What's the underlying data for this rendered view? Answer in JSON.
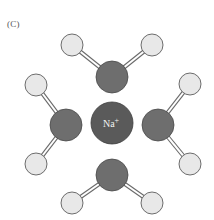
{
  "figure": {
    "panel_label": "(C)",
    "central_ion": {
      "label": "Na",
      "charge": "+",
      "cx": 112,
      "cy": 123,
      "r": 21,
      "color": "#5a5a5a"
    },
    "colors": {
      "oxygen": "#6e6e6e",
      "hydrogen": "#e8e8e8",
      "stroke": "#4a4a4a",
      "bond_outline": "#6a6a6a",
      "bond_fill": "#ffffff"
    },
    "water_molecules": [
      {
        "name": "top",
        "oxygen": {
          "cx": 112,
          "cy": 77,
          "r": 16
        },
        "hydrogens": [
          {
            "cx": 72,
            "cy": 45,
            "r": 11
          },
          {
            "cx": 152,
            "cy": 45,
            "r": 11
          }
        ]
      },
      {
        "name": "left",
        "oxygen": {
          "cx": 66,
          "cy": 125,
          "r": 16
        },
        "hydrogens": [
          {
            "cx": 36,
            "cy": 85,
            "r": 11
          },
          {
            "cx": 36,
            "cy": 164,
            "r": 11
          }
        ]
      },
      {
        "name": "right",
        "oxygen": {
          "cx": 158,
          "cy": 125,
          "r": 16
        },
        "hydrogens": [
          {
            "cx": 190,
            "cy": 84,
            "r": 11
          },
          {
            "cx": 190,
            "cy": 164,
            "r": 11
          }
        ]
      },
      {
        "name": "bottom",
        "oxygen": {
          "cx": 112,
          "cy": 175,
          "r": 16
        },
        "hydrogens": [
          {
            "cx": 72,
            "cy": 203,
            "r": 11
          },
          {
            "cx": 152,
            "cy": 203,
            "r": 11
          }
        ]
      }
    ]
  }
}
